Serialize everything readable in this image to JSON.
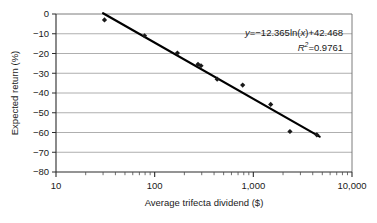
{
  "chart_data": {
    "type": "scatter",
    "title": "",
    "xlabel": "Average trifecta dividend ($)",
    "ylabel": "Expected return (%)",
    "xscale": "log",
    "xlim": [
      10,
      10000
    ],
    "ylim": [
      -80,
      0
    ],
    "grid": "horizontal",
    "legend": null,
    "xticklabels": [
      "10",
      "100",
      "1,000",
      "10,000"
    ],
    "xtickvalues": [
      10,
      100,
      1000,
      10000
    ],
    "yticklabels": [
      "0",
      "−10",
      "−20",
      "−30",
      "−40",
      "−50",
      "−60",
      "−70",
      "−80"
    ],
    "ytickvalues": [
      0,
      -10,
      -20,
      -30,
      -40,
      -50,
      -60,
      -70,
      -80
    ],
    "minor_ticks_x": true,
    "series": [
      {
        "name": "Observed expected return",
        "marker": "diamond",
        "color": "#1a1a1a",
        "points": [
          {
            "x": 31,
            "y": -3.0
          },
          {
            "x": 79,
            "y": -11.0
          },
          {
            "x": 170,
            "y": -19.8
          },
          {
            "x": 275,
            "y": -25.5
          },
          {
            "x": 295,
            "y": -26.2
          },
          {
            "x": 430,
            "y": -33.0
          },
          {
            "x": 780,
            "y": -36.0
          },
          {
            "x": 1500,
            "y": -45.8
          },
          {
            "x": 2350,
            "y": -59.5
          },
          {
            "x": 4400,
            "y": -61.2
          }
        ]
      }
    ],
    "trendline": {
      "type": "logarithmic",
      "equation_display": "y=−12.365ln(x)+42.468",
      "slope": -12.365,
      "intercept": 42.468,
      "r_squared_display": "0.9761",
      "r_squared": 0.9761,
      "color": "#000000"
    },
    "annotations": {
      "equation_y_symbol": "y",
      "equation_body": "=−12.365ln(",
      "equation_x_symbol": "x",
      "equation_tail": ")+42.468",
      "r_symbol": "R",
      "r_exponent": "2",
      "r_value": "=0.9761"
    }
  }
}
